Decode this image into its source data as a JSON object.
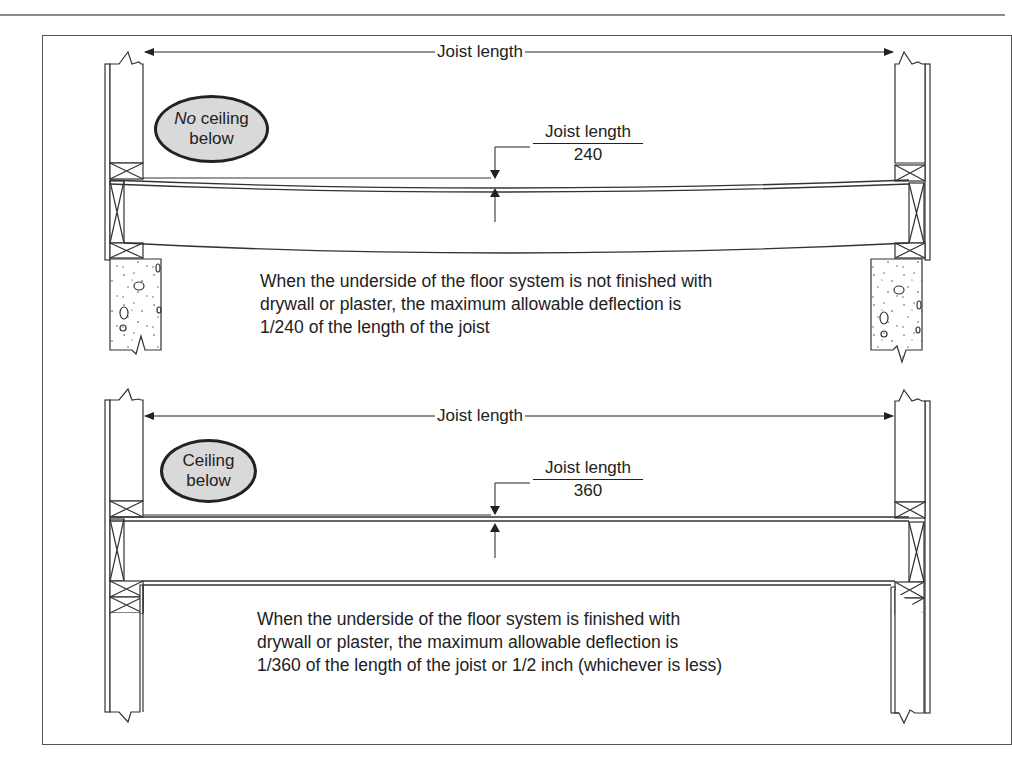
{
  "figure": {
    "top_panel": {
      "span_label": "Joist length",
      "bubble_emph": "No",
      "bubble_line1_rest": " ceiling",
      "bubble_line2": "below",
      "deflection_numerator": "Joist length",
      "deflection_denominator": "240",
      "description_lines": [
        "When the underside of the floor system is not finished with",
        "drywall or plaster, the maximum allowable deflection is",
        "1/240 of the length of the joist"
      ]
    },
    "bottom_panel": {
      "span_label": "Joist length",
      "bubble_line1": "Ceiling",
      "bubble_line2": "below",
      "deflection_numerator": "Joist length",
      "deflection_denominator": "360",
      "description_lines": [
        "When the underside of the floor system is finished with",
        "drywall or plaster, the maximum allowable deflection is",
        "1/360 of the length of the joist or 1/2 inch (whichever is less)"
      ]
    }
  }
}
